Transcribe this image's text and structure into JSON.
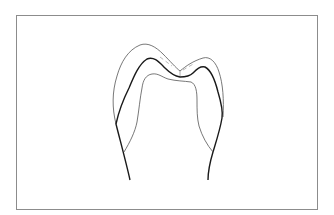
{
  "figure": {
    "labels": [],
    "stroke_colors": {
      "frame": "#8c8c8c",
      "outer_outline": "#555555",
      "dentin_enamel_junction": "#1a1a1a",
      "pulp_outline": "#555555",
      "fissure_dash": "#888888"
    },
    "parts": [
      {
        "id": "outer-enamel-outline",
        "description": "thin outer crown surface"
      },
      {
        "id": "dentinoenamel-junction",
        "description": "thick middle line"
      },
      {
        "id": "pulp-outline",
        "description": "thin inner line"
      },
      {
        "id": "fissure-dashes",
        "description": "dashed lines near central fissure"
      }
    ]
  }
}
